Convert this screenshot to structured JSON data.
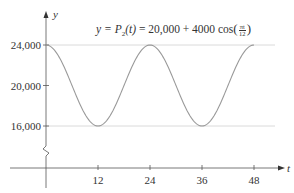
{
  "chart_data": {
    "type": "line",
    "formula": {
      "lhs": "y = ",
      "func": "P",
      "sub": "2",
      "arg": "(t)",
      "rhs": " = 20,000 + 4000 cos",
      "frac_num": "πt",
      "frac_den": "12"
    },
    "xlabel": "t",
    "ylabel": "y",
    "x_ticks": [
      12,
      24,
      36,
      48
    ],
    "x_tick_labels": [
      "12",
      "24",
      "36",
      "48"
    ],
    "y_ticks": [
      16000,
      20000,
      24000
    ],
    "y_tick_labels": [
      "16,000",
      "20,000",
      "24,000"
    ],
    "xlim": [
      0,
      48
    ],
    "ylim": [
      16000,
      24000
    ],
    "axis_break": true,
    "gridlines": [
      16000,
      24000
    ],
    "series": [
      {
        "name": "P2(t)",
        "equation": "20000 + 4000*cos(pi*t/12)",
        "x": [
          0,
          6,
          12,
          18,
          24,
          30,
          36,
          42,
          48
        ],
        "values": [
          24000,
          20000,
          16000,
          20000,
          24000,
          20000,
          16000,
          20000,
          24000
        ]
      }
    ],
    "colors": {
      "curve": "#9a9a9a",
      "axes": "#555555",
      "grid": "#d0d0d0",
      "text": "#333333"
    }
  }
}
